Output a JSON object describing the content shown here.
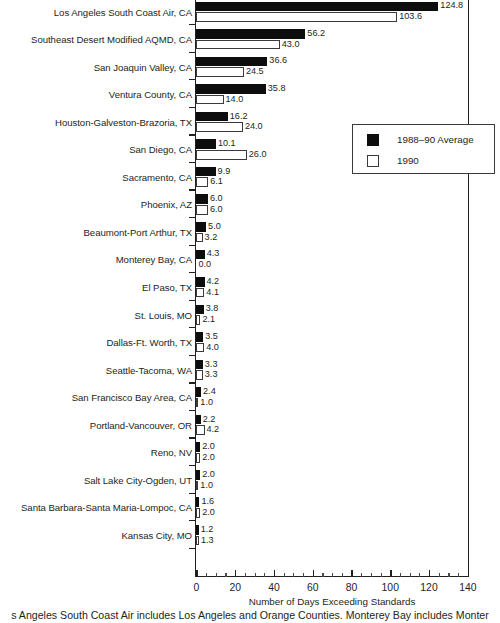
{
  "chart_data": {
    "type": "bar",
    "orientation": "horizontal",
    "title": "",
    "xlabel": "Number of Days Exceeding Standards",
    "ylabel": "",
    "xlim": [
      0,
      140
    ],
    "xticks": [
      0,
      20,
      40,
      60,
      80,
      100,
      120,
      140
    ],
    "xtick_labels": [
      "0",
      "20",
      "40",
      "60",
      "80",
      "100",
      "120",
      "140"
    ],
    "minor_tick_step": 5,
    "grid": false,
    "legend_position": "right-upper",
    "categories": [
      "Los Angeles South Coast Air, CA",
      "Southeast Desert Modified AQMD, CA",
      "San Joaquin Valley, CA",
      "Ventura County, CA",
      "Houston-Galveston-Brazoria, TX",
      "San Diego, CA",
      "Sacramento, CA",
      "Phoenix, AZ",
      "Beaumont-Port Arthur, TX",
      "Monterey Bay, CA",
      "El Paso, TX",
      "St. Louis, MO",
      "Dallas-Ft. Worth, TX",
      "Seattle-Tacoma, WA",
      "San Francisco Bay Area, CA",
      "Portland-Vancouver, OR",
      "Reno, NV",
      "Salt Lake City-Ogden, UT",
      "Santa Barbara-Santa Maria-Lompoc, CA",
      "Kansas City, MO"
    ],
    "series": [
      {
        "name": "1988–90 Average",
        "color": "#0d0d0d",
        "values": [
          124.8,
          56.2,
          36.6,
          35.8,
          16.2,
          10.1,
          9.9,
          6.0,
          5.0,
          4.3,
          4.2,
          3.8,
          3.5,
          3.3,
          2.4,
          2.2,
          2.0,
          2.0,
          1.6,
          1.2
        ],
        "labels": [
          "124.8",
          "56.2",
          "36.6",
          "35.8",
          "16.2",
          "10.1",
          "9.9",
          "6.0",
          "5.0",
          "4.3",
          "4.2",
          "3.8",
          "3.5",
          "3.3",
          "2.4",
          "2.2",
          "2.0",
          "2.0",
          "1.6",
          "1.2"
        ]
      },
      {
        "name": "1990",
        "color": "#ffffff",
        "values": [
          103.6,
          43.0,
          24.5,
          14.0,
          24.0,
          26.0,
          6.1,
          6.0,
          3.2,
          0.0,
          4.1,
          2.1,
          4.0,
          3.3,
          1.0,
          4.2,
          2.0,
          1.0,
          2.0,
          1.3
        ],
        "labels": [
          "103.6",
          "43.0",
          "24.5",
          "14.0",
          "24.0",
          "26.0",
          "6.1",
          "6.0",
          "3.2",
          "0.0",
          "4.1",
          "2.1",
          "4.0",
          "3.3",
          "1.0",
          "4.2",
          "2.0",
          "1.0",
          "2.0",
          "1.3"
        ]
      }
    ]
  },
  "legend": {
    "items": [
      {
        "label": "1988–90 Average",
        "swatch": "filled-black"
      },
      {
        "label": "1990",
        "swatch": "outline-white"
      }
    ]
  },
  "axis": {
    "x_title": "Number of Days Exceeding Standards"
  },
  "footnote": {
    "text": "s Angeles South Coast Air includes Los Angeles and Orange Counties. Monterey Bay includes Monter"
  }
}
